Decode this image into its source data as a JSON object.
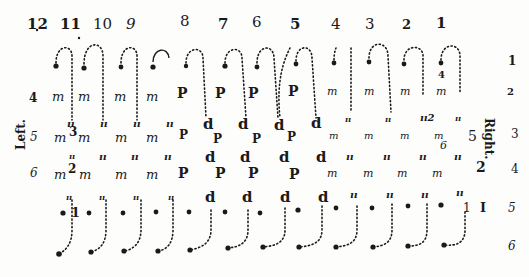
{
  "diagram": {
    "title_fragment": "...",
    "column_numbers": [
      "12",
      "11",
      "10",
      "9",
      "8",
      "7",
      "6",
      "5",
      "4",
      "3",
      "2",
      "1"
    ],
    "right_row_numbers": [
      "1",
      "2",
      "3",
      "4",
      "5",
      "6"
    ],
    "left_row_numbers": [
      "4",
      "5",
      "6"
    ],
    "side_labels": {
      "left": "Left.",
      "right": "Right."
    },
    "rows": {
      "row4": [
        "m",
        "m",
        "m",
        "m",
        "P",
        "P",
        "P",
        "P",
        "m",
        "m",
        "m",
        "m"
      ],
      "row4b": [
        "ıı",
        "ıı",
        "ıı",
        "ıı",
        "d",
        "d",
        "d",
        "d",
        "ıı",
        "ıı",
        "ıı2",
        "ıı"
      ],
      "row5": [
        "m",
        "m",
        "m",
        "m",
        "P",
        "P",
        "P",
        "P",
        "m",
        "m",
        "m",
        "m"
      ],
      "row5b": [
        "ıı",
        "ıı",
        "ıı",
        "ıı",
        "d",
        "d",
        "d",
        "d",
        "ıı",
        "ıı",
        "ıı",
        "ıı"
      ],
      "row6": [
        "m",
        "m",
        "m",
        "m",
        "P",
        "P",
        "P",
        "P",
        "m",
        "m",
        "m",
        "m"
      ],
      "row6b": [
        "ıı",
        "ıı",
        "ıı",
        "ıı",
        "d",
        "d",
        "d",
        "d",
        "ıı",
        "ıı",
        "ıı",
        "ıı"
      ]
    },
    "markers": {
      "col1_upper": "4",
      "row5_left": "3",
      "row6_left": "2",
      "bottom_left": "1",
      "right_5": "5",
      "right_6": "6",
      "right_2": "2",
      "right_1": "1",
      "right_I": "I"
    }
  }
}
